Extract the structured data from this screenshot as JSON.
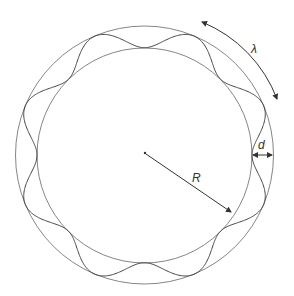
{
  "diagram": {
    "labels": {
      "wavelength": "λ",
      "displacement": "d",
      "radius": "R"
    },
    "colors": {
      "stroke": "#555555",
      "text": "#333333"
    }
  }
}
